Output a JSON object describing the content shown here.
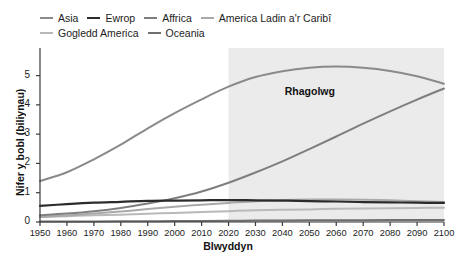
{
  "chart_data": {
    "type": "line",
    "title": "",
    "xlabel": "Blwyddyn",
    "ylabel": "Nifer y bobl (biliynau)",
    "xlim": [
      1950,
      2100
    ],
    "ylim": [
      0,
      5.6
    ],
    "grid": false,
    "legend_position": "top-left",
    "x": [
      1950,
      1960,
      1970,
      1980,
      1990,
      2000,
      2010,
      2020,
      2030,
      2040,
      2050,
      2060,
      2070,
      2080,
      2090,
      2100
    ],
    "xticks": [
      "1950",
      "1960",
      "1970",
      "1980",
      "1990",
      "2000",
      "2010",
      "2020",
      "2030",
      "2040",
      "2050",
      "2060",
      "2070",
      "2080",
      "2090",
      "2100"
    ],
    "yticks": [
      "0",
      "1",
      "2",
      "3",
      "4",
      "5"
    ],
    "series": [
      {
        "name": "Asia",
        "color": "#8a8a8a",
        "width": 2.0,
        "values": [
          1.4,
          1.7,
          2.14,
          2.64,
          3.2,
          3.72,
          4.19,
          4.62,
          4.95,
          5.15,
          5.27,
          5.31,
          5.27,
          5.16,
          4.98,
          4.72
        ]
      },
      {
        "name": "Ewrop",
        "color": "#2b2b2b",
        "width": 2.2,
        "values": [
          0.55,
          0.61,
          0.66,
          0.69,
          0.72,
          0.73,
          0.74,
          0.75,
          0.74,
          0.73,
          0.71,
          0.7,
          0.68,
          0.67,
          0.66,
          0.65
        ]
      },
      {
        "name": "Affrica",
        "color": "#7e7e7e",
        "width": 2.0,
        "values": [
          0.23,
          0.29,
          0.37,
          0.48,
          0.63,
          0.81,
          1.04,
          1.34,
          1.69,
          2.07,
          2.49,
          2.92,
          3.36,
          3.78,
          4.18,
          4.56
        ]
      },
      {
        "name": "America Ladin a'r Caribî",
        "color": "#a9a9a9",
        "width": 2.0,
        "values": [
          0.17,
          0.22,
          0.29,
          0.36,
          0.44,
          0.52,
          0.59,
          0.65,
          0.71,
          0.75,
          0.77,
          0.77,
          0.76,
          0.74,
          0.71,
          0.68
        ]
      },
      {
        "name": "Gogledd America",
        "color": "#b9b9b9",
        "width": 2.0,
        "values": [
          0.17,
          0.2,
          0.23,
          0.25,
          0.28,
          0.31,
          0.34,
          0.37,
          0.4,
          0.42,
          0.43,
          0.45,
          0.46,
          0.47,
          0.48,
          0.49
        ]
      },
      {
        "name": "Oceania",
        "color": "#6f6f6f",
        "width": 2.0,
        "values": [
          0.013,
          0.016,
          0.02,
          0.023,
          0.027,
          0.031,
          0.037,
          0.043,
          0.048,
          0.053,
          0.057,
          0.061,
          0.064,
          0.067,
          0.07,
          0.072
        ]
      }
    ],
    "annotations": [
      {
        "text": "Rhagolwg",
        "x": 2052,
        "y": 4.45
      }
    ],
    "shaded_region": {
      "label": "Rhagolwg",
      "x_start": 2020,
      "x_end": 2100,
      "color": "#ebebeb"
    }
  }
}
